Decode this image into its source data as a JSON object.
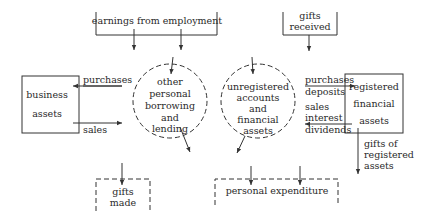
{
  "diagram": {
    "sources": {
      "earnings": {
        "label": "earnings from employment"
      },
      "gifts_received": {
        "line1": "gifts",
        "line2": "received"
      }
    },
    "nodes": {
      "business_assets": {
        "line1": "business",
        "line2": "assets"
      },
      "other_borrowing": {
        "line1": "other",
        "line2": "personal",
        "line3": "borrowing",
        "line4": "and",
        "line5": "lending"
      },
      "unregistered": {
        "line1": "unregistered",
        "line2": "accounts",
        "line3": "and",
        "line4": "financial",
        "line5": "assets"
      },
      "registered": {
        "line1": "registered",
        "line2": "financial",
        "line3": "assets"
      }
    },
    "sinks": {
      "gifts_made": {
        "line1": "gifts",
        "line2": "made"
      },
      "personal_expenditure": {
        "label": "personal expenditure"
      }
    },
    "flows": {
      "business_purchases": "purchases",
      "business_sales": "sales",
      "registered_in_line1": "purchases",
      "registered_in_line2": "deposits",
      "registered_out_line1": "sales",
      "registered_out_line2": "interest",
      "registered_out_line3": "dividends",
      "gifts_registered_line1": "gifts of",
      "gifts_registered_line2": "registered",
      "gifts_registered_line3": "assets"
    }
  }
}
